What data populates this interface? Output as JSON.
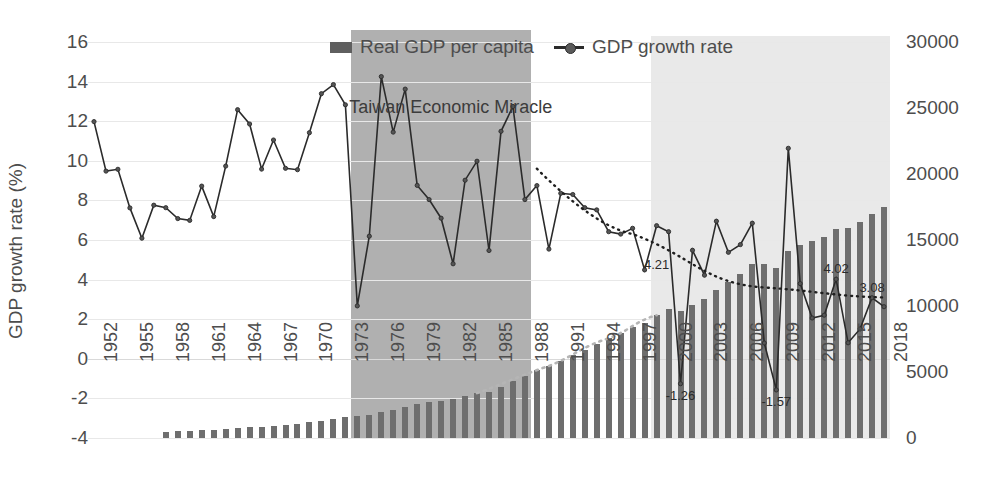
{
  "chart_data": {
    "type": "bar",
    "title": "",
    "xlabel": "",
    "ylabel": "GDP growth rate (%)",
    "y2label": "",
    "ylim": [
      -4,
      16
    ],
    "y2lim": [
      0,
      30000
    ],
    "ytick_labels": [
      "16",
      "14",
      "12",
      "10",
      "8",
      "6",
      "4",
      "2",
      "0",
      "-2",
      "-4"
    ],
    "ytick_values": [
      16,
      14,
      12,
      10,
      8,
      6,
      4,
      2,
      0,
      -2,
      -4
    ],
    "y2tick_labels": [
      "30000",
      "25000",
      "20000",
      "15000",
      "10000",
      "5000",
      "0"
    ],
    "y2tick_values": [
      30000,
      25000,
      20000,
      15000,
      10000,
      5000,
      0
    ],
    "grid": true,
    "legend_position": "top-center",
    "legend": [
      {
        "label": "Real GDP per capita",
        "marker": "bar",
        "color": "#5f5f5f"
      },
      {
        "label": "GDP growth rate",
        "marker": "line-dot",
        "color": "#2b2b2b"
      }
    ],
    "annotations": [
      {
        "text": "Taiwan Economic Miracle",
        "x_year": 1980,
        "y_pct": 13.2
      },
      {
        "text": "4.21",
        "x_year": 1999,
        "y_pct": 4.21
      },
      {
        "text": "4.02",
        "x_year": 2014,
        "y_pct": 4.02
      },
      {
        "text": "3.08",
        "x_year": 2017,
        "y_pct": 3.08
      },
      {
        "text": "-1.26",
        "x_year": 2001,
        "y_pct": -1.26
      },
      {
        "text": "-1.57",
        "x_year": 2009,
        "y_pct": -1.57
      }
    ],
    "shaded_regions": [
      {
        "name": "Taiwan Economic Miracle",
        "start_year": 1974,
        "end_year": 1989,
        "color": "#b0b0b0"
      },
      {
        "name": "Recent period",
        "start_year": 1999,
        "end_year": 2019,
        "color": "#e9e9e9"
      }
    ],
    "categories": [
      1952,
      1953,
      1954,
      1955,
      1956,
      1957,
      1958,
      1959,
      1960,
      1961,
      1962,
      1963,
      1964,
      1965,
      1966,
      1967,
      1968,
      1969,
      1970,
      1971,
      1972,
      1973,
      1974,
      1975,
      1976,
      1977,
      1978,
      1979,
      1980,
      1981,
      1982,
      1983,
      1984,
      1985,
      1986,
      1987,
      1988,
      1989,
      1990,
      1991,
      1992,
      1993,
      1994,
      1995,
      1996,
      1997,
      1998,
      1999,
      2000,
      2001,
      2002,
      2003,
      2004,
      2005,
      2006,
      2007,
      2008,
      2009,
      2010,
      2011,
      2012,
      2013,
      2014,
      2015,
      2016,
      2017,
      2018
    ],
    "xtick_labels": [
      "1952",
      "1955",
      "1958",
      "1961",
      "1964",
      "1967",
      "1970",
      "1973",
      "1976",
      "1979",
      "1982",
      "1985",
      "1988",
      "1991",
      "1994",
      "1997",
      "2000",
      "2003",
      "2006",
      "2009",
      "2012",
      "2015",
      "2018"
    ],
    "series": [
      {
        "name": "GDP growth rate",
        "type": "line",
        "axis": "left",
        "unit": "%",
        "color": "#2b2b2b",
        "values": [
          11.98,
          9.48,
          9.57,
          7.62,
          6.09,
          7.76,
          7.63,
          7.08,
          6.99,
          8.72,
          7.18,
          9.73,
          12.58,
          11.86,
          9.58,
          11.05,
          9.62,
          9.55,
          11.42,
          13.39,
          13.85,
          12.83,
          2.67,
          6.19,
          14.25,
          11.45,
          13.62,
          8.76,
          8.04,
          7.1,
          4.8,
          9.02,
          9.98,
          5.47,
          11.49,
          12.74,
          8.04,
          8.75,
          5.54,
          8.36,
          8.3,
          7.63,
          7.52,
          6.42,
          6.3,
          6.59,
          4.49,
          6.72,
          6.42,
          -1.26,
          5.48,
          4.22,
          6.95,
          5.38,
          5.77,
          6.85,
          0.8,
          -1.57,
          10.63,
          3.8,
          2.06,
          2.2,
          4.02,
          0.81,
          1.51,
          3.08,
          2.63
        ]
      },
      {
        "name": "Real GDP per capita",
        "type": "bar",
        "axis": "right",
        "unit": "USD",
        "color": "#6e6e6e",
        "values": [
          0,
          0,
          0,
          0,
          0,
          0,
          480,
          500,
          540,
          570,
          610,
          660,
          730,
          800,
          860,
          940,
          1010,
          1080,
          1180,
          1300,
          1450,
          1600,
          1660,
          1740,
          1940,
          2100,
          2350,
          2550,
          2700,
          2830,
          2950,
          3150,
          3400,
          3500,
          3850,
          4300,
          4700,
          5150,
          5450,
          5850,
          6300,
          6700,
          7150,
          7550,
          7950,
          8400,
          8700,
          9300,
          9800,
          9600,
          10100,
          10500,
          11200,
          11800,
          12400,
          13200,
          13200,
          12900,
          14200,
          14600,
          14900,
          15200,
          15800,
          15900,
          16400,
          17000,
          17500
        ]
      },
      {
        "name": "Real GDP per capita trend",
        "type": "dashed-trend",
        "axis": "right",
        "color": "#a0a0a0",
        "note": "light dashed rising curve from mid-1980s"
      },
      {
        "name": "GDP growth rate trend",
        "type": "dotted-trend",
        "axis": "left",
        "color": "#1f1f1f",
        "note": "dotted declining trend line from 1989 to 2018"
      }
    ]
  }
}
